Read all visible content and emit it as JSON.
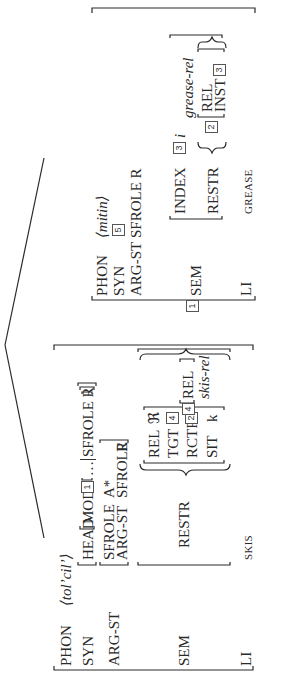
{
  "diagram": {
    "type": "HPSG tree with attribute-value matrices",
    "orientation": "rotated 90 degrees counter-clockwise",
    "left_daughter": {
      "phon_label": "PHON",
      "phon_value": "⟨tol’cil’⟩",
      "syn_label": "SYN",
      "head_label": "HEAD",
      "mod_label": "MOD",
      "mod_tag": "1",
      "mod_rest": "…",
      "mod_sfrole": "SFROLE R",
      "argst_label": "ARG-ST",
      "inner_sfrole_label": "SFROLE",
      "inner_sfrole_value": "A*",
      "inner_argst_label": "ARG-ST",
      "inner_argst_sfrole_label": "SFROLE",
      "inner_argst_sfrole_value": "R",
      "sem_label": "SEM",
      "restr_label": "RESTR",
      "restr_item1": {
        "rel_label": "REL",
        "rel_value": "ℜ",
        "tgt_label": "TGT",
        "tgt_tag": "4",
        "rctr_label": "RCTR",
        "rctr_tag": "2",
        "sit_label": "SIT",
        "sit_value": "k"
      },
      "comma": ",",
      "restr_item2_tag": "4",
      "restr_item2_rel_label": "REL",
      "restr_item2_rel_value": "skis-rel",
      "li_label": "LI",
      "li_value": "SKIS"
    },
    "right_daughter": {
      "tag": "1",
      "phon_label": "PHON",
      "phon_value": "⟨mitin⟩",
      "syn_label": "SYN",
      "syn_tag": "5",
      "argst_label": "ARG-ST",
      "argst_value": "SFROLE R",
      "sem_label": "SEM",
      "index_label": "INDEX",
      "index_tag": "3",
      "index_var": "i",
      "restr_label": "RESTR",
      "restr_tag": "2",
      "rel_label": "REL",
      "rel_value": "grease-rel",
      "inst_label": "INST",
      "inst_tag": "3",
      "li_label": "LI",
      "li_value": "GREASE"
    }
  }
}
